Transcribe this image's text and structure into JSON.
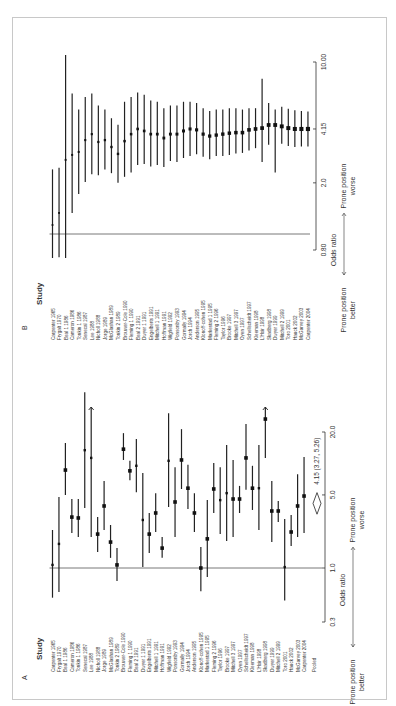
{
  "figure": {
    "panels": [
      "A",
      "B"
    ],
    "study_header": "Study",
    "axis_label": "Odds ratio",
    "better_label": [
      "Prone position",
      "better"
    ],
    "worse_label": [
      "Prone position",
      "worse"
    ]
  },
  "chart_data": [
    {
      "panel": "A",
      "type": "forest",
      "title": "A",
      "xlabel": "Odds ratio",
      "scale": "log",
      "ticks": [
        0.3,
        1.0,
        5.0,
        20.0
      ],
      "tick_labels": [
        "0.3",
        "1.0",
        "5.0",
        "20.0"
      ],
      "reference_line": 1.0,
      "direction_labels": {
        "left": "Prone position better",
        "right": "Prone position worse"
      },
      "studies": [
        {
          "name": "Carpenter 1965",
          "or": 1.07,
          "lo": 0.52,
          "hi": 2.31
        },
        {
          "name": "Frygalt 1970",
          "or": 1.7,
          "lo": 0.59,
          "hi": 4.77
        },
        {
          "name": "Beal 1 1986",
          "or": 8.65,
          "lo": 4.99,
          "hi": 15.7
        },
        {
          "name": "Cameron 1986",
          "or": 3.07,
          "lo": 2.16,
          "hi": 4.57
        },
        {
          "name": "Tonkin 1 1986",
          "or": 3.01,
          "lo": 1.98,
          "hi": 4.57
        },
        {
          "name": "Senecal 1987",
          "or": 13.4,
          "lo": 3.75,
          "hi": 48.0
        },
        {
          "name": "Lee 1988",
          "or": 11.3,
          "lo": 1.98,
          "hi": 60.0,
          "arrow": true
        },
        {
          "name": "Nicholl 1988",
          "or": 2.11,
          "lo": 1.42,
          "hi": 3.07
        },
        {
          "name": "Jorge 1989",
          "or": 3.92,
          "lo": 2.31,
          "hi": 6.8
        },
        {
          "name": "McGlashan 1989",
          "or": 1.77,
          "lo": 1.25,
          "hi": 2.58
        },
        {
          "name": "Tonkin 2 1989",
          "or": 1.07,
          "lo": 0.75,
          "hi": 1.55
        },
        {
          "name": "Brouwer-Cole 1990",
          "or": 13.7,
          "lo": 10.8,
          "hi": 19.5
        },
        {
          "name": "Fleming 1 1990",
          "or": 8.5,
          "lo": 6.9,
          "hi": 10.6
        },
        {
          "name": "Beal 2 1991",
          "or": 9.5,
          "lo": 5.3,
          "hi": 17.1
        },
        {
          "name": "Dwyer 1 1991",
          "or": 2.88,
          "lo": 1.02,
          "hi": 8.1
        },
        {
          "name": "Engelberts 1991",
          "or": 2.11,
          "lo": 1.39,
          "hi": 3.36
        },
        {
          "name": "Mitchell 1 1991",
          "or": 3.36,
          "lo": 2.21,
          "hi": 5.2
        },
        {
          "name": "Hoffman 1991",
          "or": 1.55,
          "lo": 1.25,
          "hi": 1.98
        },
        {
          "name": "Wigfield 1992",
          "or": 10.6,
          "lo": 3.83,
          "hi": 30.3
        },
        {
          "name": "Ponsonby 1993",
          "or": 4.28,
          "lo": 1.98,
          "hi": 9.2
        },
        {
          "name": "Gormally 1994",
          "or": 10.8,
          "lo": 5.7,
          "hi": 21.3
        },
        {
          "name": "Jorch 1994",
          "or": 5.8,
          "lo": 3.67,
          "hi": 9.7
        },
        {
          "name": "Anderson 1995",
          "or": 3.36,
          "lo": 2.21,
          "hi": 5.2
        },
        {
          "name": "Klonoff-cohen 1995",
          "or": 1.0,
          "lo": 0.6,
          "hi": 1.59
        },
        {
          "name": "Markestad 1 1995",
          "or": 1.9,
          "lo": 0.82,
          "hi": 4.46
        },
        {
          "name": "Fleming 2 1996",
          "or": 5.7,
          "lo": 3.36,
          "hi": 10.1
        },
        {
          "name": "Taylor 1996",
          "or": 4.46,
          "lo": 2.11,
          "hi": 9.2
        },
        {
          "name": "Brooke 1997",
          "or": 5.2,
          "lo": 1.81,
          "hi": 15.0
        },
        {
          "name": "Mitchell 3 1997",
          "or": 4.57,
          "lo": 1.98,
          "hi": 10.8
        },
        {
          "name": "Oyen 1997",
          "or": 4.57,
          "lo": 3.36,
          "hi": 6.1
        },
        {
          "name": "Schellscheidt 1997",
          "or": 11.3,
          "lo": 5.6,
          "hi": 23.8
        },
        {
          "name": "Kleeman 1998",
          "or": 5.8,
          "lo": 3.59,
          "hi": 9.5
        },
        {
          "name": "L'Hoir 1998",
          "or": 5.8,
          "lo": 2.31,
          "hi": 15.0
        },
        {
          "name": "Skadberg 1998",
          "or": 26.6,
          "lo": 11.3,
          "hi": 60.0,
          "arrow": true
        },
        {
          "name": "Dwyer 1999",
          "or": 3.51,
          "lo": 1.77,
          "hi": 6.8
        },
        {
          "name": "Mitchell 2 1999",
          "or": 3.51,
          "lo": 2.76,
          "hi": 4.37
        },
        {
          "name": "Toro 2001",
          "or": 1.02,
          "lo": 0.49,
          "hi": 2.94
        },
        {
          "name": "Hauck 2002",
          "or": 2.21,
          "lo": 1.62,
          "hi": 3.21
        },
        {
          "name": "McGarvey 2003",
          "or": 3.92,
          "lo": 1.98,
          "hi": 7.9
        },
        {
          "name": "Carpenter 2004",
          "or": 4.88,
          "lo": 2.16,
          "hi": 11.5
        }
      ],
      "pooled": {
        "name": "Pooled",
        "or": 4.15,
        "lo": 3.27,
        "hi": 5.26,
        "label": "4.15 (3.27, 5.26)"
      }
    },
    {
      "panel": "B",
      "type": "forest",
      "title": "B",
      "subtitle": "cumulative",
      "xlabel": "Odds ratio",
      "scale": "log",
      "ticks": [
        0.8,
        2.0,
        4.15,
        10.0
      ],
      "tick_labels": [
        "0.80",
        "2.0",
        "4.15",
        "10.00"
      ],
      "reference_line": 1.0,
      "direction_labels": {
        "left": "Prone position better",
        "right": "Prone position worse"
      },
      "studies": [
        {
          "name": "Carpenter 1965",
          "or": 1.13,
          "lo": 0.55,
          "hi": 2.4
        },
        {
          "name": "Frygalt 1970",
          "or": 1.33,
          "lo": 0.73,
          "hi": 2.45
        },
        {
          "name": "Beal 1 1986",
          "or": 2.73,
          "lo": 0.66,
          "hi": 11.3
        },
        {
          "name": "Cameron 1986",
          "or": 2.92,
          "lo": 1.33,
          "hi": 6.7
        },
        {
          "name": "Tonkin 1 1986",
          "or": 3.04,
          "lo": 1.72,
          "hi": 5.4
        },
        {
          "name": "Senecal 1987",
          "or": 3.57,
          "lo": 2.02,
          "hi": 6.4
        },
        {
          "name": "Lee 1988",
          "or": 3.87,
          "lo": 2.25,
          "hi": 6.7
        },
        {
          "name": "Nicholl 1988",
          "or": 3.48,
          "lo": 2.22,
          "hi": 5.7
        },
        {
          "name": "Jorge 1989",
          "or": 3.57,
          "lo": 2.4,
          "hi": 5.4
        },
        {
          "name": "McGlashan 1989",
          "or": 3.25,
          "lo": 2.28,
          "hi": 4.8
        },
        {
          "name": "Tonkin 2 1989",
          "or": 2.96,
          "lo": 2.0,
          "hi": 4.4
        },
        {
          "name": "Brouwer-Cole 1990",
          "or": 3.52,
          "lo": 2.17,
          "hi": 6.0
        },
        {
          "name": "Fleming 1 1990",
          "or": 3.87,
          "lo": 2.3,
          "hi": 6.4
        },
        {
          "name": "Beal 2 1991",
          "or": 4.15,
          "lo": 2.55,
          "hi": 6.8
        },
        {
          "name": "Dwyer 1 1991",
          "or": 4.04,
          "lo": 2.58,
          "hi": 6.6
        },
        {
          "name": "Engelberts 1991",
          "or": 3.87,
          "lo": 2.5,
          "hi": 6.1
        },
        {
          "name": "Mitchell 1 1991",
          "or": 3.87,
          "lo": 2.55,
          "hi": 6.0
        },
        {
          "name": "Hoffman 1991",
          "or": 3.67,
          "lo": 2.48,
          "hi": 5.5
        },
        {
          "name": "Wigfield 1992",
          "or": 3.87,
          "lo": 2.69,
          "hi": 5.7
        },
        {
          "name": "Ponsonby 1993",
          "or": 3.87,
          "lo": 2.65,
          "hi": 5.7
        },
        {
          "name": "Gormally 1994",
          "or": 4.04,
          "lo": 2.8,
          "hi": 6.0
        },
        {
          "name": "Jorch 1994",
          "or": 4.15,
          "lo": 2.88,
          "hi": 6.0
        },
        {
          "name": "Anderson 1995",
          "or": 4.1,
          "lo": 2.95,
          "hi": 5.9
        },
        {
          "name": "Klonoff-cohen 1995",
          "or": 3.87,
          "lo": 2.85,
          "hi": 5.5
        },
        {
          "name": "Markestad 1 1995",
          "or": 3.77,
          "lo": 2.75,
          "hi": 5.3
        },
        {
          "name": "Fleming 2 1996",
          "or": 3.82,
          "lo": 2.88,
          "hi": 5.4
        },
        {
          "name": "Taylor 1996",
          "or": 3.87,
          "lo": 2.88,
          "hi": 5.4
        },
        {
          "name": "Brooke 1997",
          "or": 3.92,
          "lo": 2.92,
          "hi": 5.5
        },
        {
          "name": "Mitchell 3 1997",
          "or": 3.95,
          "lo": 2.98,
          "hi": 5.5
        },
        {
          "name": "Oyen 1997",
          "or": 3.95,
          "lo": 3.0,
          "hi": 5.4
        },
        {
          "name": "Schellscheidt 1997",
          "or": 4.1,
          "lo": 3.1,
          "hi": 5.5
        },
        {
          "name": "Kleeman 1998",
          "or": 4.15,
          "lo": 3.2,
          "hi": 5.5
        },
        {
          "name": "L'Hoir 1998",
          "or": 4.2,
          "lo": 2.65,
          "hi": 8.2
        },
        {
          "name": "Skadberg 1998",
          "or": 4.38,
          "lo": 3.35,
          "hi": 5.9
        },
        {
          "name": "Dwyer 1999",
          "or": 4.38,
          "lo": 2.3,
          "hi": 5.4
        },
        {
          "name": "Mitchell 2 1999",
          "or": 4.3,
          "lo": 3.4,
          "hi": 5.6
        },
        {
          "name": "Toro 2001",
          "or": 4.2,
          "lo": 3.3,
          "hi": 5.45
        },
        {
          "name": "Hauck 2002",
          "or": 4.15,
          "lo": 3.25,
          "hi": 5.35
        },
        {
          "name": "McGarvey 2003",
          "or": 4.15,
          "lo": 3.27,
          "hi": 5.3
        },
        {
          "name": "Carpenter 2004",
          "or": 4.15,
          "lo": 3.27,
          "hi": 5.26
        }
      ]
    }
  ]
}
